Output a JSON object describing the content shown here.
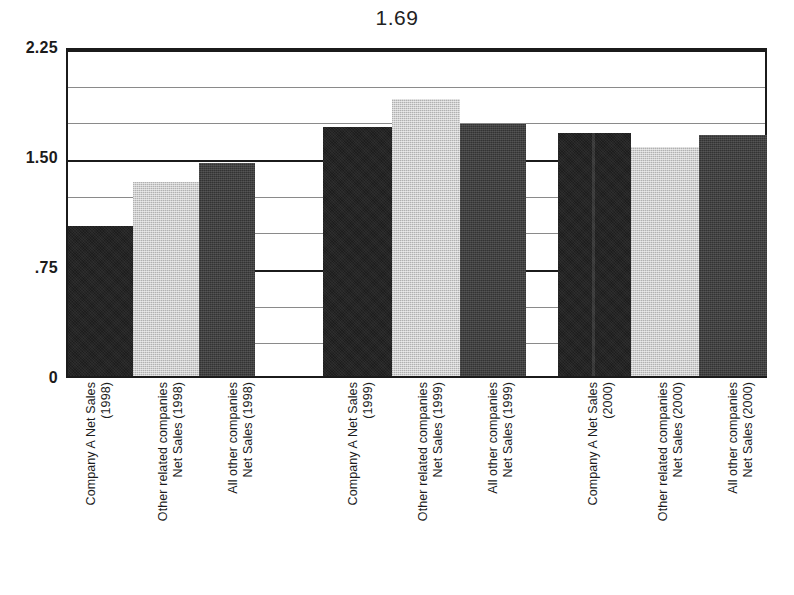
{
  "chart_data": {
    "type": "bar",
    "title": "1.69",
    "xlabel": "",
    "ylabel": "",
    "ylim": [
      0,
      2.25
    ],
    "grid": true,
    "legend": "none",
    "ytick_labels": [
      "0",
      ".75",
      "1.50",
      "2.25"
    ],
    "ytick_values": [
      0,
      0.75,
      1.5,
      2.25
    ],
    "gridline_values": [
      0.25,
      0.5,
      0.75,
      1.0,
      1.25,
      1.5,
      1.75,
      2.0,
      2.25
    ],
    "categories": [
      "Company A Net Sales\n(1998)",
      "Other related companies\nNet Sales (1998)",
      "All other companies\nNet Sales (1998)",
      "Company A Net Sales\n(1999)",
      "Other related companies\nNet Sales (1999)",
      "All other companies\nNet Sales (1999)",
      "Company A Net Sales\n(2000)",
      "Other related companies\nNet Sales (2000)",
      "All other companies\nNet Sales (2000)"
    ],
    "values": [
      1.02,
      1.32,
      1.45,
      1.7,
      1.89,
      1.72,
      1.66,
      1.56,
      1.64
    ],
    "groups": [
      {
        "year": "1998",
        "bars": [
          {
            "series": "Company A Net Sales",
            "label": "Company A Net Sales\n(1998)",
            "value": 1.02,
            "color": "#1d1d1d"
          },
          {
            "series": "Other related companies Net Sales",
            "label": "Other related companies\nNet Sales (1998)",
            "value": 1.32,
            "color": "#cfcfcf"
          },
          {
            "series": "All other companies Net Sales",
            "label": "All other companies\nNet Sales (1998)",
            "value": 1.45,
            "color": "#333333"
          }
        ]
      },
      {
        "year": "1999",
        "bars": [
          {
            "series": "Company A Net Sales",
            "label": "Company A Net Sales\n(1999)",
            "value": 1.7,
            "color": "#1d1d1d"
          },
          {
            "series": "Other related companies Net Sales",
            "label": "Other related companies\nNet Sales (1999)",
            "value": 1.89,
            "color": "#cfcfcf"
          },
          {
            "series": "All other companies Net Sales",
            "label": "All other companies\nNet Sales (1999)",
            "value": 1.72,
            "color": "#333333"
          }
        ]
      },
      {
        "year": "2000",
        "bars": [
          {
            "series": "Company A Net Sales",
            "label": "Company A Net Sales\n(2000)",
            "value": 1.66,
            "color": "#1d1d1d"
          },
          {
            "series": "Other related companies Net Sales",
            "label": "Other related companies\nNet Sales (2000)",
            "value": 1.56,
            "color": "#cfcfcf"
          },
          {
            "series": "All other companies Net Sales",
            "label": "All other companies\nNet Sales (2000)",
            "value": 1.64,
            "color": "#333333"
          }
        ]
      }
    ]
  },
  "layout": {
    "bar_geometry": [
      {
        "left": 0,
        "width": 65,
        "series": "a",
        "seam": false
      },
      {
        "left": 65,
        "width": 66,
        "series": "b",
        "seam": false
      },
      {
        "left": 131,
        "width": 56,
        "series": "c",
        "seam": false
      },
      {
        "left": 255,
        "width": 69,
        "series": "a",
        "seam": false
      },
      {
        "left": 324,
        "width": 68,
        "series": "b",
        "seam": false
      },
      {
        "left": 392,
        "width": 66,
        "series": "c",
        "seam": false
      },
      {
        "left": 490,
        "width": 73,
        "series": "a",
        "seam": true
      },
      {
        "left": 563,
        "width": 68,
        "series": "b",
        "seam": false
      },
      {
        "left": 631,
        "width": 68,
        "series": "c",
        "seam": false
      }
    ],
    "label_x": [
      18,
      90,
      160,
      280,
      350,
      420,
      520,
      590,
      660
    ]
  }
}
